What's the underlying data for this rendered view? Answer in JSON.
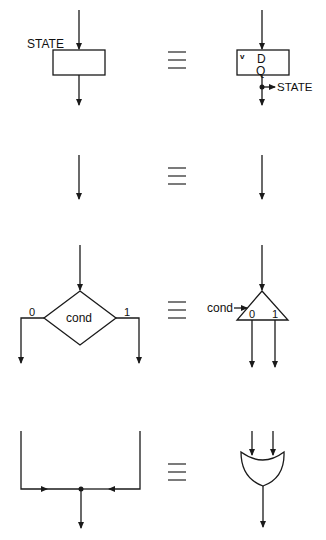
{
  "diagram": {
    "equivalence_symbol": "≡",
    "rows": [
      {
        "name": "state-box",
        "left": {
          "type": "state-box",
          "label": "STATE"
        },
        "right": {
          "type": "d-flip-flop",
          "input_label": "D",
          "output_label": "Q",
          "clock_mark": "v",
          "output_tap_label": "STATE"
        }
      },
      {
        "name": "plain-arrow",
        "left": {
          "type": "arrow"
        },
        "right": {
          "type": "arrow"
        }
      },
      {
        "name": "decision-box",
        "left": {
          "type": "decision-diamond",
          "label": "cond",
          "false_label": "0",
          "true_label": "1"
        },
        "right": {
          "type": "demultiplexer",
          "select_label": "cond",
          "out0_label": "0",
          "out1_label": "1"
        }
      },
      {
        "name": "junction",
        "left": {
          "type": "path-merge"
        },
        "right": {
          "type": "or-gate"
        }
      }
    ]
  }
}
